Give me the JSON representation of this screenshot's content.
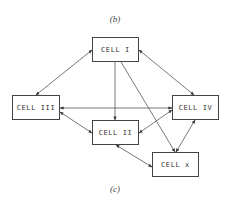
{
  "captions": {
    "top": "(b)",
    "bottom": "(c)"
  },
  "cells": {
    "cell_1": {
      "label": "CELL I",
      "x": 92,
      "y": 37,
      "w": 47,
      "h": 25
    },
    "cell_2": {
      "label": "CELL II",
      "x": 92,
      "y": 120,
      "w": 47,
      "h": 25
    },
    "cell_3": {
      "label": "CELL III",
      "x": 12,
      "y": 95,
      "w": 48,
      "h": 25
    },
    "cell_4": {
      "label": "CELL IV",
      "x": 172,
      "y": 95,
      "w": 47,
      "h": 25
    },
    "cell_x": {
      "label": "CELL x",
      "x": 152,
      "y": 152,
      "w": 47,
      "h": 25
    }
  },
  "connections": [
    {
      "from": "CELL I",
      "to": "CELL III",
      "bidirectional": true
    },
    {
      "from": "CELL I",
      "to": "CELL IV",
      "bidirectional": true
    },
    {
      "from": "CELL I",
      "to": "CELL II",
      "bidirectional": false
    },
    {
      "from": "CELL I",
      "to": "CELL x",
      "bidirectional": false
    },
    {
      "from": "CELL III",
      "to": "CELL IV",
      "bidirectional": true
    },
    {
      "from": "CELL III",
      "to": "CELL II",
      "bidirectional": true
    },
    {
      "from": "CELL II",
      "to": "CELL IV",
      "bidirectional": true
    },
    {
      "from": "CELL II",
      "to": "CELL x",
      "bidirectional": true
    },
    {
      "from": "CELL IV",
      "to": "CELL x",
      "bidirectional": true
    }
  ]
}
